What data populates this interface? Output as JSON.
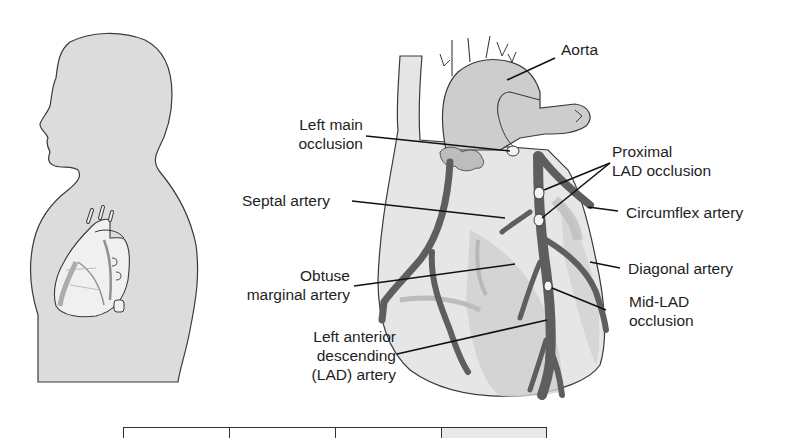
{
  "figure": {
    "labels": {
      "aorta": [
        "Aorta"
      ],
      "left_main_occlusion": [
        "Left main",
        "occlusion"
      ],
      "septal_artery": [
        "Septal artery"
      ],
      "obtuse_marginal_artery": [
        "Obtuse",
        "marginal artery"
      ],
      "lad_artery": [
        "Left anterior",
        "descending",
        "(LAD) artery"
      ],
      "proximal_lad_occlusion": [
        "Proximal",
        "LAD occlusion"
      ],
      "circumflex_artery": [
        "Circumflex artery"
      ],
      "diagonal_artery": [
        "Diagonal artery"
      ],
      "mid_lad_occlusion": [
        "Mid-LAD",
        "occlusion"
      ]
    },
    "colors": {
      "silhouette": "#dcdcdc",
      "heart_fill": "#e6e6e6",
      "heart_shade": "#c8c8c8",
      "artery": "#5e5e5e",
      "outline": "#3a3a3a",
      "occlusion": "#f4f4f4"
    },
    "table": {
      "cells": 4
    }
  }
}
